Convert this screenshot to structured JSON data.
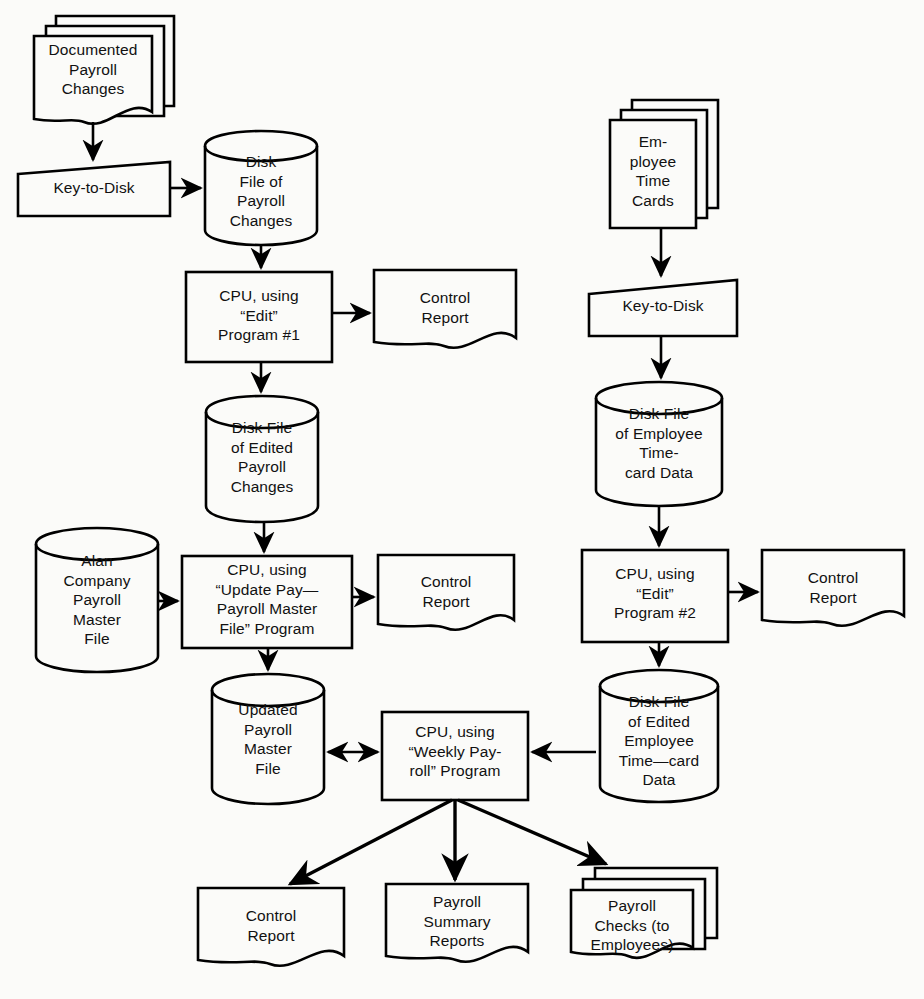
{
  "diagram": {
    "type": "system-flowchart",
    "background_color": "#fbfbf9",
    "line_color": "#000000",
    "nodes": [
      {
        "id": "documented-payroll-changes",
        "shape": "document-stack",
        "label": "Documented\nPayroll\nChanges",
        "x": 30,
        "y": 16,
        "w": 144,
        "h": 110
      },
      {
        "id": "key-to-disk-1",
        "shape": "manual-input",
        "label": "Key-to-Disk",
        "x": 18,
        "y": 164,
        "w": 152,
        "h": 52
      },
      {
        "id": "disk-file-payroll-changes",
        "shape": "cylinder",
        "label": "Disk\nFile of\nPayroll\nChanges",
        "x": 205,
        "y": 132,
        "w": 112,
        "h": 112
      },
      {
        "id": "cpu-edit-program-1",
        "shape": "process",
        "label": "CPU, using\n“Edit”\nProgram #1",
        "x": 186,
        "y": 272,
        "w": 146,
        "h": 90
      },
      {
        "id": "control-report-1",
        "shape": "document",
        "label": "Control\nReport",
        "x": 374,
        "y": 270,
        "w": 142,
        "h": 82
      },
      {
        "id": "disk-file-edited-payroll-changes",
        "shape": "cylinder",
        "label": "Disk File\nof Edited\nPayroll\nChanges",
        "x": 206,
        "y": 396,
        "w": 112,
        "h": 124
      },
      {
        "id": "alan-company-payroll-master-file",
        "shape": "cylinder",
        "label": "Alan\nCompany\nPayroll\nMaster\nFile",
        "x": 36,
        "y": 528,
        "w": 122,
        "h": 142
      },
      {
        "id": "cpu-update-payroll-master-file",
        "shape": "process",
        "label": "CPU, using\n“Update Pay—\nPayroll  Master\nFile” Program",
        "x": 182,
        "y": 556,
        "w": 170,
        "h": 92
      },
      {
        "id": "control-report-2",
        "shape": "document",
        "label": "Control\nReport",
        "x": 378,
        "y": 555,
        "w": 136,
        "h": 82
      },
      {
        "id": "updated-payroll-master-file",
        "shape": "cylinder",
        "label": "Updated\nPayroll\nMaster\nFile",
        "x": 212,
        "y": 676,
        "w": 112,
        "h": 126
      },
      {
        "id": "cpu-weekly-payroll-program",
        "shape": "process",
        "label": "CPU, using\n“Weekly Pay-\nroll” Program",
        "x": 382,
        "y": 712,
        "w": 146,
        "h": 88
      },
      {
        "id": "employee-time-cards",
        "shape": "document-stack",
        "label": "Em-\nployee\nTime\nCards",
        "x": 608,
        "y": 100,
        "w": 110,
        "h": 126
      },
      {
        "id": "key-to-disk-2",
        "shape": "manual-input",
        "label": "Key-to-Disk",
        "x": 589,
        "y": 282,
        "w": 148,
        "h": 54
      },
      {
        "id": "disk-file-employee-timecard-data",
        "shape": "cylinder",
        "label": "Disk File\nof Employee\nTime-\ncard Data",
        "x": 596,
        "y": 382,
        "w": 126,
        "h": 124
      },
      {
        "id": "cpu-edit-program-2",
        "shape": "process",
        "label": "CPU, using\n“Edit”\nProgram #2",
        "x": 582,
        "y": 550,
        "w": 146,
        "h": 92
      },
      {
        "id": "control-report-3",
        "shape": "document",
        "label": "Control\nReport",
        "x": 762,
        "y": 550,
        "w": 142,
        "h": 82
      },
      {
        "id": "disk-file-edited-employee-timecard-data",
        "shape": "cylinder",
        "label": "Disk File\nof Edited\nEmployee\nTime—card\nData",
        "x": 600,
        "y": 672,
        "w": 118,
        "h": 130
      },
      {
        "id": "control-report-4",
        "shape": "document",
        "label": "Control\nReport",
        "x": 198,
        "y": 888,
        "w": 146,
        "h": 88
      },
      {
        "id": "payroll-summary-reports",
        "shape": "document",
        "label": "Payroll\nSummary\nReports",
        "x": 386,
        "y": 884,
        "w": 142,
        "h": 90
      },
      {
        "id": "payroll-checks-to-employees",
        "shape": "document-stack",
        "label": "Payroll\nChecks (to\nEmployees)",
        "x": 571,
        "y": 868,
        "w": 146,
        "h": 94
      }
    ],
    "edges": [
      {
        "from": "documented-payroll-changes",
        "to": "key-to-disk-1",
        "style": "arrow"
      },
      {
        "from": "key-to-disk-1",
        "to": "disk-file-payroll-changes",
        "style": "arrow"
      },
      {
        "from": "disk-file-payroll-changes",
        "to": "cpu-edit-program-1",
        "style": "arrow"
      },
      {
        "from": "cpu-edit-program-1",
        "to": "control-report-1",
        "style": "arrow"
      },
      {
        "from": "cpu-edit-program-1",
        "to": "disk-file-edited-payroll-changes",
        "style": "arrow"
      },
      {
        "from": "disk-file-edited-payroll-changes",
        "to": "cpu-update-payroll-master-file",
        "style": "arrow"
      },
      {
        "from": "alan-company-payroll-master-file",
        "to": "cpu-update-payroll-master-file",
        "style": "arrow"
      },
      {
        "from": "cpu-update-payroll-master-file",
        "to": "control-report-2",
        "style": "arrow"
      },
      {
        "from": "cpu-update-payroll-master-file",
        "to": "updated-payroll-master-file",
        "style": "arrow"
      },
      {
        "from": "updated-payroll-master-file",
        "to": "cpu-weekly-payroll-program",
        "style": "double-arrow"
      },
      {
        "from": "employee-time-cards",
        "to": "key-to-disk-2",
        "style": "arrow"
      },
      {
        "from": "key-to-disk-2",
        "to": "disk-file-employee-timecard-data",
        "style": "arrow"
      },
      {
        "from": "disk-file-employee-timecard-data",
        "to": "cpu-edit-program-2",
        "style": "arrow"
      },
      {
        "from": "cpu-edit-program-2",
        "to": "control-report-3",
        "style": "arrow"
      },
      {
        "from": "cpu-edit-program-2",
        "to": "disk-file-edited-employee-timecard-data",
        "style": "arrow"
      },
      {
        "from": "disk-file-edited-employee-timecard-data",
        "to": "cpu-weekly-payroll-program",
        "style": "arrow"
      },
      {
        "from": "cpu-weekly-payroll-program",
        "to": "control-report-4",
        "style": "arrow"
      },
      {
        "from": "cpu-weekly-payroll-program",
        "to": "payroll-summary-reports",
        "style": "arrow"
      },
      {
        "from": "cpu-weekly-payroll-program",
        "to": "payroll-checks-to-employees",
        "style": "arrow"
      }
    ]
  }
}
